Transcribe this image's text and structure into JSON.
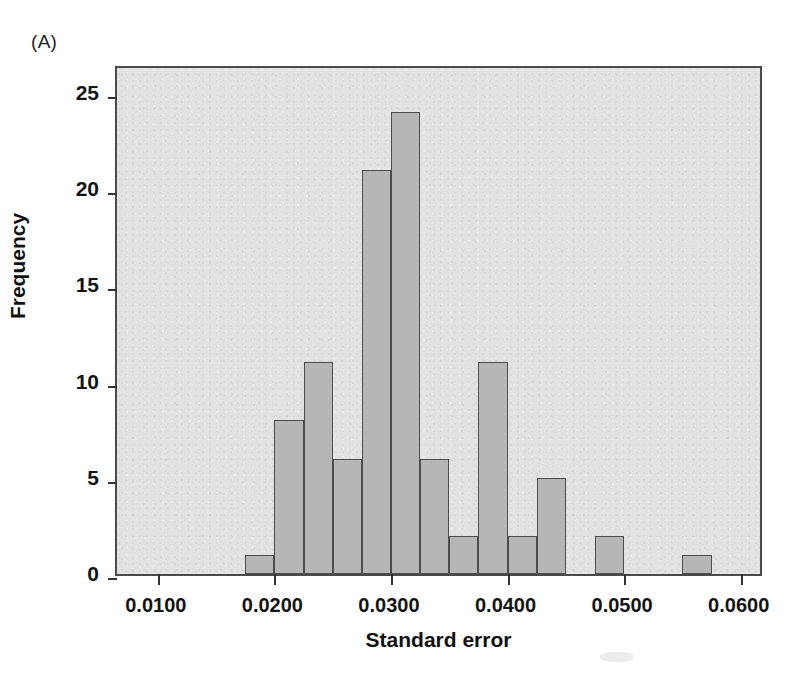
{
  "figure": {
    "panel_label": "(A)",
    "background_color": "#ffffff",
    "plot_background_color": "#e2e2e0",
    "bar_fill_color": "#b6b6b4",
    "bar_edge_color": "#4d4d4d",
    "axis_color": "#333333"
  },
  "chart_data": {
    "type": "bar",
    "title": "(A)",
    "xlabel": "Standard error",
    "ylabel": "Frequency",
    "xlim": [
      0.0065,
      0.062
    ],
    "ylim": [
      0,
      26.5
    ],
    "grid": false,
    "legend": null,
    "bin_width": 0.0025,
    "xticks": [
      0.01,
      0.02,
      0.03,
      0.04,
      0.05,
      0.06
    ],
    "xtick_labels": [
      "0.0100",
      "0.0200",
      "0.0300",
      "0.0400",
      "0.0500",
      "0.0600"
    ],
    "yticks": [
      0,
      5,
      10,
      15,
      20,
      25
    ],
    "ytick_labels": [
      "0",
      "5",
      "10",
      "15",
      "20",
      "25"
    ],
    "bins": [
      {
        "left": 0.0175,
        "right": 0.02,
        "value": 1
      },
      {
        "left": 0.02,
        "right": 0.0225,
        "value": 8
      },
      {
        "left": 0.0225,
        "right": 0.025,
        "value": 11
      },
      {
        "left": 0.025,
        "right": 0.0275,
        "value": 6
      },
      {
        "left": 0.0275,
        "right": 0.03,
        "value": 21
      },
      {
        "left": 0.03,
        "right": 0.0325,
        "value": 24
      },
      {
        "left": 0.0325,
        "right": 0.035,
        "value": 6
      },
      {
        "left": 0.035,
        "right": 0.0375,
        "value": 2
      },
      {
        "left": 0.0375,
        "right": 0.04,
        "value": 11
      },
      {
        "left": 0.04,
        "right": 0.0425,
        "value": 2
      },
      {
        "left": 0.0425,
        "right": 0.045,
        "value": 5
      },
      {
        "left": 0.0475,
        "right": 0.05,
        "value": 2
      },
      {
        "left": 0.055,
        "right": 0.0575,
        "value": 1
      }
    ],
    "categories": [
      "0.0175",
      "0.0200",
      "0.0225",
      "0.0250",
      "0.0275",
      "0.0300",
      "0.0325",
      "0.0350",
      "0.0375",
      "0.0400",
      "0.0425",
      "0.0475",
      "0.0550"
    ],
    "values": [
      1,
      8,
      11,
      6,
      21,
      24,
      6,
      2,
      11,
      2,
      5,
      2,
      1
    ]
  }
}
